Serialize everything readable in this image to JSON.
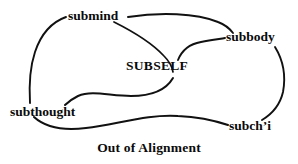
{
  "figure": {
    "title": "Out of Alignment",
    "caption": "Out of Alignment",
    "background_color": "#ffffff",
    "stroke_color": "#111111"
  },
  "nodes": [
    {
      "id": "submind",
      "label": "submind"
    },
    {
      "id": "subbody",
      "label": "subbody"
    },
    {
      "id": "subself",
      "label": "SUBSELF"
    },
    {
      "id": "subthought",
      "label": "subthought"
    },
    {
      "id": "subchi",
      "label": "subch’i"
    }
  ],
  "edges": [
    {
      "id": "submind-subbody",
      "from": "submind",
      "to": "subbody",
      "style": "hand-drawn-curve"
    },
    {
      "id": "submind-subself",
      "from": "submind",
      "to": "subself",
      "style": "hand-drawn-curve"
    },
    {
      "id": "submind-subthought",
      "from": "submind",
      "to": "subthought",
      "style": "hand-drawn-curve"
    },
    {
      "id": "subself-subbody",
      "from": "subself",
      "to": "subbody",
      "style": "hand-drawn-curve"
    },
    {
      "id": "subself-subthought",
      "from": "subself",
      "to": "subthought",
      "style": "hand-drawn-curve"
    },
    {
      "id": "subbody-subchi",
      "from": "subbody",
      "to": "subchi",
      "style": "hand-drawn-curve"
    },
    {
      "id": "subthought-subchi",
      "from": "subthought",
      "to": "subchi",
      "style": "hand-drawn-curve"
    }
  ]
}
